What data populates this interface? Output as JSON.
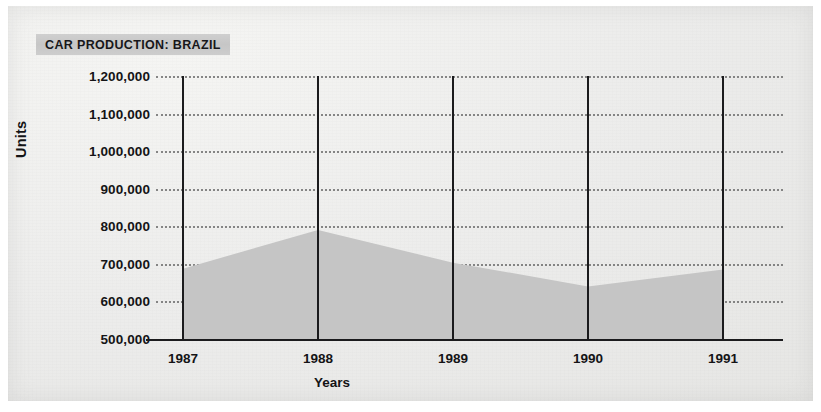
{
  "figure": {
    "title": "CAR PRODUCTION: BRAZIL",
    "title_band_color": "#c8c8c8",
    "paper_color": "#ececea",
    "area_fill_color": "#c5c5c5",
    "axis_color": "#1b1b1d",
    "gridline_color": "#6e6e6e"
  },
  "bleed_through": {
    "line_a": " ",
    "line_b": " ",
    "line_c": " ",
    "line_d": " "
  },
  "chart_data": {
    "type": "area",
    "title": "CAR PRODUCTION: BRAZIL",
    "xlabel": "Years",
    "ylabel": "Units",
    "categories": [
      "1987",
      "1988",
      "1989",
      "1990",
      "1991"
    ],
    "x": [
      1987,
      1988,
      1989,
      1990,
      1991
    ],
    "values": [
      687000,
      790000,
      703000,
      640000,
      685000
    ],
    "series": [
      {
        "name": "Car production",
        "values": [
          687000,
          790000,
          703000,
          640000,
          685000
        ]
      }
    ],
    "ylim": [
      500000,
      1200000
    ],
    "ytick_values": [
      1200000,
      1100000,
      1000000,
      900000,
      800000,
      700000,
      600000,
      500000
    ],
    "ytick_labels": [
      "1,200,000",
      "1,100,000",
      "1,000,000",
      "900,000",
      "800,000",
      "700,000",
      "600,000",
      "500,000"
    ],
    "xtick_labels": [
      "1987",
      "1988",
      "1989",
      "1990",
      "1991"
    ],
    "grid": "horizontal-dotted",
    "legend": "none",
    "fill": true,
    "baseline": 500000
  }
}
